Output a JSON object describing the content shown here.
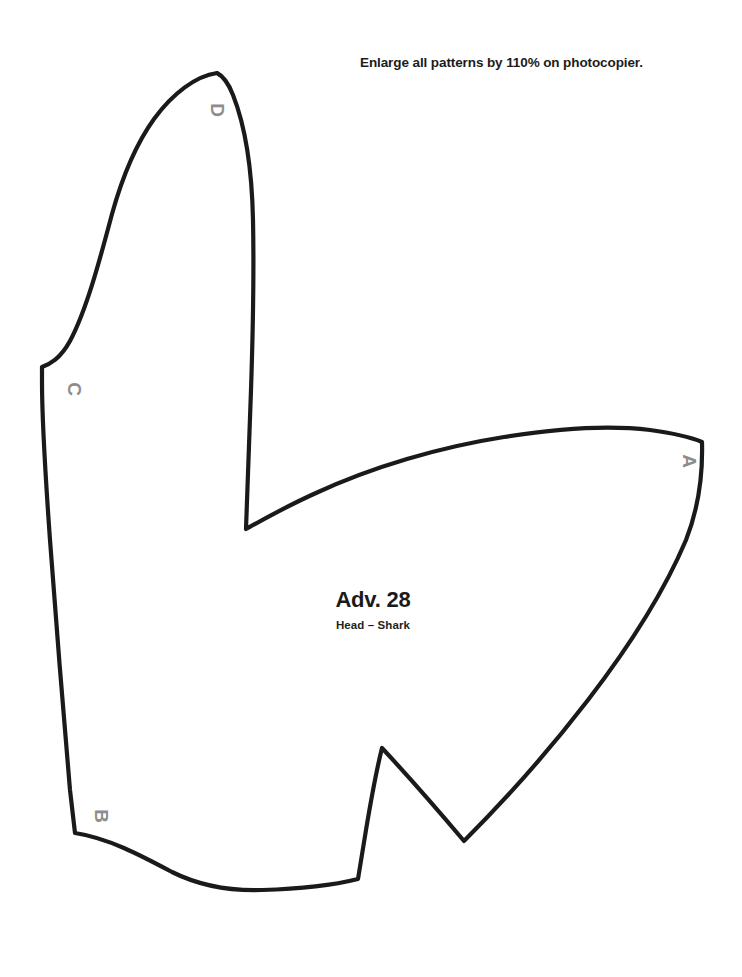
{
  "page": {
    "background_color": "#ffffff",
    "width": 742,
    "height": 977
  },
  "instruction": {
    "text": "Enlarge all patterns by 110% on photocopier.",
    "color": "#1c1c1c"
  },
  "caption": {
    "number": "Adv. 28",
    "piece_name": "Head – Shark",
    "color": "#1a1a1a"
  },
  "pattern": {
    "outline_color": "#1a1a1a",
    "fill_color": "#ffffff",
    "stroke_width": 4.2,
    "path": "M 217 73 C 196 76 173 93 154 119 C 136 144 122 178 112 214 C 99 263 86 311 70 341 C 60 359 50 364 42 367 L 42 382 C 42 420 45 470 50 540 C 56 620 63 710 70 790 L 75 833 C 108 838 140 855 172 872 C 200 886 232 891 262 890 C 296 889 330 886 358 879 L 366 830 C 371 800 376 772 382 748 C 409 777 437 809 464 841 C 505 800 548 752 588 700 C 628 648 664 592 686 540 C 697 512 703 478 702 442 C 690 437 672 433 650 430 C 610 425 560 428 504 437 C 440 447 372 467 316 493 C 287 506 264 519 246 529 C 247 490 249 440 251 390 C 253 330 254 268 253 220 C 252 172 246 128 233 95 C 228 82 223 76 217 73 Z"
  },
  "notches": [
    {
      "label": "A",
      "x": 683,
      "y": 461,
      "rotation": 90
    },
    {
      "label": "B",
      "x": 95,
      "y": 816,
      "rotation": 90
    },
    {
      "label": "C",
      "x": 68,
      "y": 389,
      "rotation": 90
    },
    {
      "label": "D",
      "x": 211,
      "y": 110,
      "rotation": 90
    }
  ]
}
